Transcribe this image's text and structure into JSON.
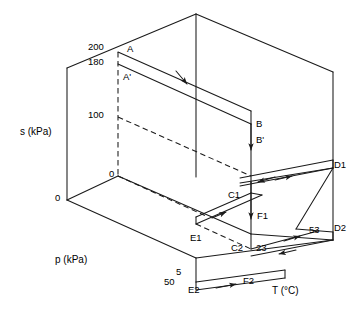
{
  "figure": {
    "type": "3d-process-diagram",
    "stroke_color": "#1a1a1a",
    "background_color": "#ffffff"
  },
  "axes": {
    "s_axis_label": "s (kPa)",
    "p_axis_label": "p (kPa)",
    "t_axis_label": "T (°C)",
    "origin_label": "0"
  },
  "s_ticks": [
    {
      "value": "200"
    },
    {
      "value": "180"
    },
    {
      "value": "100"
    },
    {
      "value": "0"
    }
  ],
  "t_ticks": [
    {
      "value": "5"
    },
    {
      "value": "23"
    },
    {
      "value": "53"
    }
  ],
  "p_ticks": [
    {
      "value": "50"
    }
  ],
  "points": [
    {
      "id": "A",
      "label": "A"
    },
    {
      "id": "Ap",
      "label": "A'"
    },
    {
      "id": "B",
      "label": "B"
    },
    {
      "id": "Bp",
      "label": "B'"
    },
    {
      "id": "C1",
      "label": "C1"
    },
    {
      "id": "C2",
      "label": "C2"
    },
    {
      "id": "D1",
      "label": "D1"
    },
    {
      "id": "D2",
      "label": "D2"
    },
    {
      "id": "E1",
      "label": "E1"
    },
    {
      "id": "E2",
      "label": "E2"
    },
    {
      "id": "F1",
      "label": "F1"
    },
    {
      "id": "F2",
      "label": "F2"
    }
  ]
}
